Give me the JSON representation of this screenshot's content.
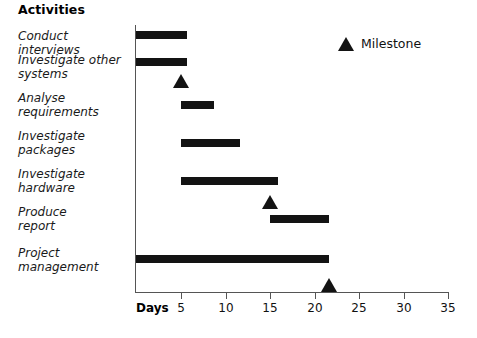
{
  "chart_data": {
    "type": "bar",
    "subtype": "gantt",
    "title": "Activities",
    "xlabel": "Days",
    "ylabel": "Activities",
    "xlim": [
      0,
      35
    ],
    "xticks": [
      5,
      10,
      15,
      20,
      25,
      30,
      35
    ],
    "xtick_labels": [
      "5",
      "10",
      "15",
      "20",
      "25",
      "30",
      "35"
    ],
    "grid": false,
    "legend": {
      "position": "top-right",
      "entries": [
        {
          "label": "Milestone",
          "marker": "triangle",
          "color": "#131313"
        }
      ]
    },
    "categories": [
      "Conduct interviews",
      "Investigate other systems",
      "Analyse requirements",
      "Investigate packages",
      "Investigate hardware",
      "Produce report",
      "Project management"
    ],
    "tasks": [
      {
        "name": "Conduct interviews",
        "start": 0,
        "end": 5.5,
        "duration": 5.5
      },
      {
        "name": "Investigate other systems",
        "start": 0,
        "end": 5.5,
        "duration": 5.5
      },
      {
        "name": "Analyse requirements",
        "start": 5,
        "end": 8.7,
        "duration": 3.7
      },
      {
        "name": "Investigate packages",
        "start": 5,
        "end": 11.6,
        "duration": 6.6
      },
      {
        "name": "Investigate hardware",
        "start": 5,
        "end": 16,
        "duration": 11
      },
      {
        "name": "Produce report",
        "start": 15,
        "end": 21.5,
        "duration": 6.5
      },
      {
        "name": "Project management",
        "start": 0,
        "end": 21.5,
        "duration": 21.5
      }
    ],
    "milestones": [
      {
        "day": 5,
        "after": "Investigate other systems"
      },
      {
        "day": 15,
        "after": "Investigate hardware"
      },
      {
        "day": 21.5,
        "after": "Project management"
      }
    ],
    "colors": {
      "bar": "#131313",
      "milestone": "#131313",
      "axis": "#555555"
    }
  },
  "chart": {
    "title": "Activities",
    "days_label": "Days",
    "legend_label": "Milestone",
    "labels": [
      {
        "text": "Conduct interviews",
        "top": 29
      },
      {
        "text": "Investigate other\nsystems",
        "top": 53
      },
      {
        "text": "Analyse\nrequirements",
        "top": 91
      },
      {
        "text": "Investigate\npackages",
        "top": 129
      },
      {
        "text": "Investigate\nhardware",
        "top": 167
      },
      {
        "text": "Produce\nreport",
        "top": 205
      },
      {
        "text": "Project\nmanagement",
        "top": 246
      }
    ],
    "bars": [
      {
        "name": "conduct-interviews",
        "left": 136,
        "width": 51,
        "top": 31
      },
      {
        "name": "investigate-other-systems",
        "left": 136,
        "width": 51,
        "top": 58
      },
      {
        "name": "analyse-requirements",
        "left": 181,
        "width": 33,
        "top": 101
      },
      {
        "name": "investigate-packages",
        "left": 181,
        "width": 59,
        "top": 139
      },
      {
        "name": "investigate-hardware",
        "left": 181,
        "width": 97,
        "top": 177
      },
      {
        "name": "produce-report",
        "left": 270,
        "width": 59,
        "top": 215
      },
      {
        "name": "project-management",
        "left": 136,
        "width": 193,
        "top": 255
      }
    ],
    "milestone_markers": [
      {
        "name": "milestone-day-5",
        "left": 173,
        "top": 74
      },
      {
        "name": "milestone-day-15",
        "left": 262,
        "top": 195
      },
      {
        "name": "milestone-day-21",
        "left": 321,
        "top": 278
      }
    ],
    "ticks": [
      {
        "label": "5",
        "x": 181
      },
      {
        "label": "10",
        "x": 226
      },
      {
        "label": "15",
        "x": 270
      },
      {
        "label": "20",
        "x": 315
      },
      {
        "label": "25",
        "x": 359
      },
      {
        "label": "30",
        "x": 404
      },
      {
        "label": "35",
        "x": 448
      }
    ]
  }
}
